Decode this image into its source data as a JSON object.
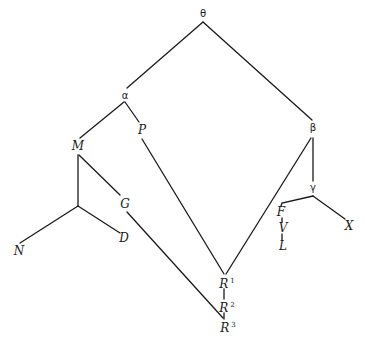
{
  "diagram": {
    "type": "stemma-codicum",
    "nodes": [
      {
        "id": "theta",
        "label": "θ",
        "kind": "hyparchetype",
        "x": 203,
        "y": 14
      },
      {
        "id": "alpha",
        "label": "α",
        "kind": "hyparchetype",
        "x": 125,
        "y": 96
      },
      {
        "id": "beta",
        "label": "β",
        "kind": "hyparchetype",
        "x": 313,
        "y": 127
      },
      {
        "id": "gamma",
        "label": "γ",
        "kind": "hyparchetype",
        "x": 313,
        "y": 187
      },
      {
        "id": "M",
        "label": "M",
        "kind": "manuscript",
        "x": 78,
        "y": 145
      },
      {
        "id": "P",
        "label": "P",
        "kind": "manuscript",
        "x": 142,
        "y": 130
      },
      {
        "id": "G",
        "label": "G",
        "kind": "manuscript",
        "x": 125,
        "y": 203
      },
      {
        "id": "D",
        "label": "D",
        "kind": "manuscript",
        "x": 124,
        "y": 238
      },
      {
        "id": "N",
        "label": "N",
        "kind": "manuscript",
        "x": 18,
        "y": 251
      },
      {
        "id": "F",
        "label": "F",
        "kind": "manuscript",
        "x": 281,
        "y": 212
      },
      {
        "id": "V",
        "label": "V",
        "kind": "manuscript",
        "x": 283,
        "y": 228
      },
      {
        "id": "L",
        "label": "L",
        "kind": "manuscript",
        "x": 283,
        "y": 246
      },
      {
        "id": "X",
        "label": "X",
        "kind": "manuscript",
        "x": 349,
        "y": 226
      },
      {
        "id": "R1",
        "label": "R",
        "sup": "1",
        "kind": "manuscript",
        "x": 225,
        "y": 282
      },
      {
        "id": "R2",
        "label": "R",
        "sup": "2",
        "kind": "manuscript",
        "x": 225,
        "y": 306
      },
      {
        "id": "R3",
        "label": "R",
        "sup": "3",
        "kind": "manuscript",
        "x": 226,
        "y": 326
      }
    ],
    "edges": [
      {
        "from": "theta",
        "to": "alpha"
      },
      {
        "from": "theta",
        "to": "beta"
      },
      {
        "from": "alpha",
        "to": "M"
      },
      {
        "from": "alpha",
        "to": "P"
      },
      {
        "from": "M",
        "to": "G"
      },
      {
        "from": "M",
        "to": "junction"
      },
      {
        "from": "junction",
        "to": "N"
      },
      {
        "from": "junction",
        "to": "D"
      },
      {
        "from": "G",
        "to": "R3"
      },
      {
        "from": "P",
        "to": "R1"
      },
      {
        "from": "beta",
        "to": "R1"
      },
      {
        "from": "beta",
        "to": "gamma"
      },
      {
        "from": "gamma",
        "to": "F"
      },
      {
        "from": "gamma",
        "to": "X"
      },
      {
        "from": "F",
        "to": "V"
      },
      {
        "from": "V",
        "to": "L"
      },
      {
        "from": "R1",
        "to": "R2"
      },
      {
        "from": "R2",
        "to": "R3"
      }
    ]
  },
  "labels": {
    "theta": "θ",
    "alpha": "α",
    "beta": "β",
    "gamma": "γ",
    "M": "M",
    "P": "P",
    "G": "G",
    "D": "D",
    "N": "N",
    "F": "F",
    "V": "V",
    "L": "L",
    "X": "X",
    "R1": "R",
    "R1_sup": "1",
    "R2": "R",
    "R2_sup": "2",
    "R3": "R",
    "R3_sup": "3"
  },
  "colors": {
    "ink": "#1a1a1a",
    "paper": "#ffffff"
  }
}
